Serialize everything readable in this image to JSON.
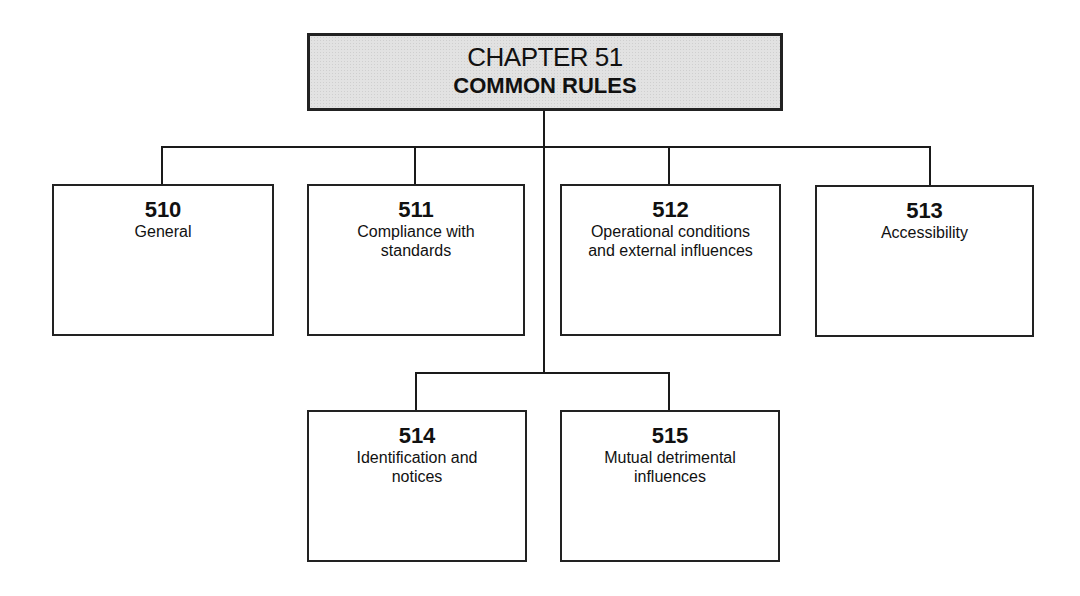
{
  "title": {
    "chapter": "CHAPTER 51",
    "subtitle": "COMMON RULES"
  },
  "sections": [
    {
      "number": "510",
      "label": "General"
    },
    {
      "number": "511",
      "label": "Compliance with standards"
    },
    {
      "number": "512",
      "label": "Operational conditions and external influences"
    },
    {
      "number": "513",
      "label": "Accessibility"
    },
    {
      "number": "514",
      "label": "Identification and notices"
    },
    {
      "number": "515",
      "label": "Mutual detrimental influences"
    }
  ],
  "colors": {
    "title_fill": "#e2e2e2",
    "border": "#222222",
    "background": "#ffffff"
  }
}
